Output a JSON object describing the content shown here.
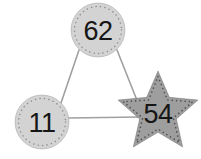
{
  "canvas": {
    "width": 201,
    "height": 159,
    "background_color": "#ffffff"
  },
  "graph": {
    "nodes": [
      {
        "id": "node-62",
        "label": "62",
        "shape": "circle",
        "cx": 98,
        "cy": 30,
        "r": 27,
        "fill_color": "#d3d3d3",
        "border_color": "#8d8d8d",
        "border_style": "dotted",
        "label_color": "#161616"
      },
      {
        "id": "node-11",
        "label": "11",
        "shape": "circle",
        "cx": 42,
        "cy": 122,
        "r": 27,
        "fill_color": "#d3d3d3",
        "border_color": "#8d8d8d",
        "border_style": "dotted",
        "label_color": "#161616"
      },
      {
        "id": "node-54",
        "label": "54",
        "shape": "star",
        "cx": 158,
        "cy": 113,
        "r": 42,
        "fill_color": "#9e9e9e",
        "border_color": "#4f4f4f",
        "border_style": "dotted",
        "label_color": "#161616"
      }
    ],
    "edges": [
      {
        "id": "edge-62-11",
        "from": "62",
        "to": "11",
        "x1": 79,
        "y1": 50,
        "x2": 61,
        "y2": 103,
        "color": "#a0a0a0",
        "width": 1.6
      },
      {
        "id": "edge-62-54",
        "from": "62",
        "to": "54",
        "x1": 117,
        "y1": 50,
        "x2": 144,
        "y2": 118,
        "color": "#a0a0a0",
        "width": 1.6
      },
      {
        "id": "edge-11-54",
        "from": "11",
        "to": "54",
        "x1": 69,
        "y1": 118,
        "x2": 140,
        "y2": 117,
        "color": "#a0a0a0",
        "width": 1.6
      }
    ]
  }
}
